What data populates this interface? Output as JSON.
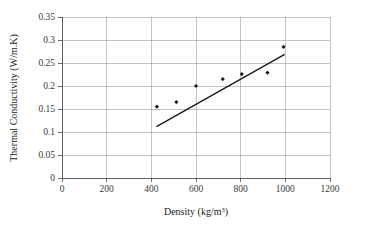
{
  "chart_data": {
    "type": "scatter",
    "title": "",
    "xlabel": "Density (kg/m3)",
    "xlabel_base": "Density (kg/m",
    "xlabel_sup": "3",
    "xlabel_tail": ")",
    "ylabel": "Thermal Conductivity (W/m.K)",
    "xlim": [
      0,
      1200
    ],
    "ylim": [
      0,
      0.35
    ],
    "grid": true,
    "legend": "none",
    "x_ticks": [
      "0",
      "200",
      "400",
      "600",
      "800",
      "1000",
      "1200"
    ],
    "x_tick_values": [
      0,
      200,
      400,
      600,
      800,
      1000,
      1200
    ],
    "y_ticks": [
      "0",
      "0.05",
      "0.1",
      "0.15",
      "0.2",
      "0.25",
      "0.3",
      "0.35"
    ],
    "y_tick_values": [
      0,
      0.05,
      0.1,
      0.15,
      0.2,
      0.25,
      0.3,
      0.35
    ],
    "series": [
      {
        "name": "Measured data",
        "kind": "scatter",
        "marker": "filled-diamond",
        "color": "#1a1a1a",
        "points": [
          {
            "x": 425,
            "y": 0.155
          },
          {
            "x": 512,
            "y": 0.165
          },
          {
            "x": 600,
            "y": 0.2
          },
          {
            "x": 720,
            "y": 0.215
          },
          {
            "x": 805,
            "y": 0.226
          },
          {
            "x": 920,
            "y": 0.229
          },
          {
            "x": 992,
            "y": 0.285
          }
        ]
      },
      {
        "name": "Linear trendline",
        "kind": "line",
        "color": "#1a1a1a",
        "points": [
          {
            "x": 425,
            "y": 0.112
          },
          {
            "x": 995,
            "y": 0.268
          }
        ]
      }
    ]
  },
  "axes": {
    "x_axis_name": "density-axis",
    "y_axis_name": "thermal-conductivity-axis"
  }
}
